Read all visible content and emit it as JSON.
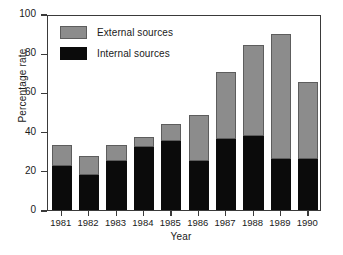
{
  "chart_data": {
    "type": "bar",
    "stacked": true,
    "title": "",
    "xlabel": "Year",
    "ylabel": "Percentage rate",
    "categories": [
      "1981",
      "1982",
      "1983",
      "1984",
      "1985",
      "1986",
      "1987",
      "1988",
      "1989",
      "1990"
    ],
    "series": [
      {
        "name": "Internal sources",
        "color": "#0b0b0b",
        "values": [
          22.4,
          17.8,
          25.0,
          32.0,
          35.0,
          25.0,
          36.0,
          38.0,
          26.0,
          26.0
        ]
      },
      {
        "name": "External sources",
        "color": "#8c8c8c",
        "values": [
          10.8,
          9.7,
          8.0,
          5.2,
          9.0,
          23.5,
          34.5,
          46.0,
          63.8,
          39.3
        ]
      }
    ],
    "totals": [
      33.2,
      27.5,
      33.0,
      37.2,
      44.0,
      48.5,
      70.5,
      84.0,
      89.8,
      65.3
    ],
    "ylim": [
      0,
      100
    ],
    "yticks": [
      0,
      20,
      40,
      60,
      80,
      100
    ],
    "ytick_labels": [
      "0",
      "20",
      "40",
      "60",
      "80",
      "100"
    ],
    "grid": false,
    "legend_position": "top-left",
    "legend": [
      {
        "label": "External sources",
        "color": "#8c8c8c"
      },
      {
        "label": "Internal sources",
        "color": "#0b0b0b"
      }
    ]
  }
}
